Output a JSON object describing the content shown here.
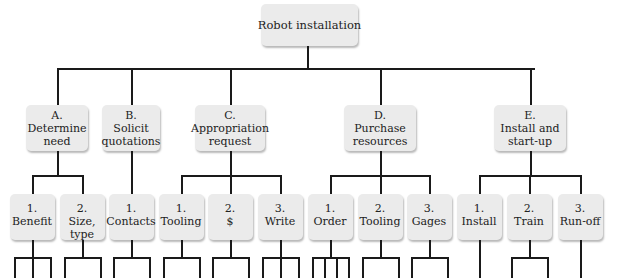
{
  "root": {
    "label": "Robot installation"
  },
  "tasks": [
    {
      "letter": "A.",
      "line1": "Determine",
      "line2": "need",
      "subtasks": [
        {
          "num": "1.",
          "line1": "Benefit",
          "line2": "",
          "branches": 3
        },
        {
          "num": "2.",
          "line1": "Size,",
          "line2": "type",
          "branches": 2
        }
      ]
    },
    {
      "letter": "B.",
      "line1": "Solicit",
      "line2": "quotations",
      "subtasks": [
        {
          "num": "1.",
          "line1": "Contacts",
          "line2": "",
          "branches": 2
        }
      ]
    },
    {
      "letter": "C.",
      "line1": "Appropriation",
      "line2": "request",
      "subtasks": [
        {
          "num": "1.",
          "line1": "Tooling",
          "line2": "",
          "branches": 2
        },
        {
          "num": "2.",
          "line1": "$",
          "line2": "",
          "branches": 2
        },
        {
          "num": "3.",
          "line1": "Write",
          "line2": "",
          "branches": 3
        }
      ]
    },
    {
      "letter": "D.",
      "line1": "Purchase",
      "line2": "resources",
      "subtasks": [
        {
          "num": "1.",
          "line1": "Order",
          "line2": "",
          "branches": 4
        },
        {
          "num": "2.",
          "line1": "Tooling",
          "line2": "",
          "branches": 2
        },
        {
          "num": "3.",
          "line1": "Gages",
          "line2": "",
          "branches": 2
        }
      ]
    },
    {
      "letter": "E.",
      "line1": "Install and",
      "line2": "start-up",
      "subtasks": [
        {
          "num": "1.",
          "line1": "Install",
          "line2": "",
          "branches": 1
        },
        {
          "num": "2.",
          "line1": "Train",
          "line2": "",
          "branches": 2
        },
        {
          "num": "3.",
          "line1": "Run-off",
          "line2": "",
          "branches": 1
        }
      ]
    }
  ],
  "colors": {
    "box_fill": "#ebebeb",
    "line": "#1a1a1a",
    "text": "#222222"
  }
}
